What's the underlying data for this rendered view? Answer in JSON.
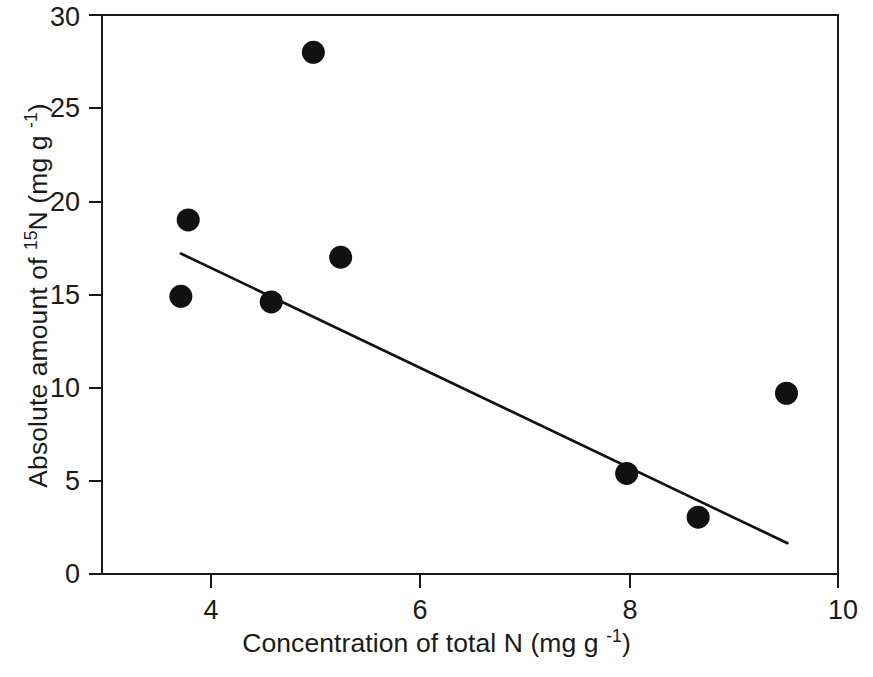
{
  "chart_data": {
    "type": "scatter",
    "title": "",
    "xlabel": "Concentration of total N (mg  g -1)",
    "ylabel": "Absolute amount of 15N (mg g -1)",
    "xlim": [
      3,
      10
    ],
    "ylim": [
      0,
      30
    ],
    "xticks": [
      4,
      6,
      8,
      10
    ],
    "yticks": [
      0,
      5,
      10,
      15,
      20,
      25,
      30
    ],
    "xtick_labels": [
      "4",
      "6",
      "8",
      "10"
    ],
    "ytick_labels": [
      "0",
      "5",
      "10",
      "15",
      "20",
      "25",
      "30"
    ],
    "grid": false,
    "legend": "none",
    "marker": "filled-circle",
    "marker_color": "#111111",
    "x": [
      3.75,
      3.82,
      4.61,
      5.01,
      5.27,
      7.99,
      8.67,
      9.51
    ],
    "y": [
      14.9,
      19.0,
      14.6,
      28.0,
      17.0,
      5.4,
      3.05,
      9.7
    ],
    "points": [
      {
        "x": 3.75,
        "y": 14.9
      },
      {
        "x": 3.82,
        "y": 19.0
      },
      {
        "x": 4.61,
        "y": 14.6
      },
      {
        "x": 5.01,
        "y": 28.0
      },
      {
        "x": 5.27,
        "y": 17.0
      },
      {
        "x": 7.99,
        "y": 5.4
      },
      {
        "x": 8.67,
        "y": 3.05
      },
      {
        "x": 9.51,
        "y": 9.7
      }
    ],
    "trend_line": {
      "type": "linear-fit",
      "x_start": 3.75,
      "y_start": 17.2,
      "x_end": 9.52,
      "y_end": 1.65
    }
  },
  "axes": {
    "x_title_parts": {
      "main": "Concentration of total N (mg  g ",
      "exponent": "-1",
      "tail": ")"
    },
    "y_title_parts": {
      "lead": "Absolute amount of ",
      "isotope": "15",
      "mid": "N (mg g ",
      "exponent": "-1",
      "tail": ")"
    }
  }
}
